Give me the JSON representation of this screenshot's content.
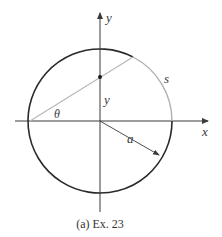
{
  "figure": {
    "caption": "(a)  Ex. 23",
    "labels": {
      "y_axis": "y",
      "x_axis": "x",
      "theta": "θ",
      "y_segment": "y",
      "arc": "s",
      "radius": "a"
    },
    "geometry": {
      "center": [
        100,
        121
      ],
      "radius": 72,
      "chord_start": [
        28,
        121
      ],
      "chord_end": [
        133,
        57
      ],
      "dot": [
        100,
        77
      ],
      "radius_arrow_end": [
        160,
        155
      ]
    },
    "colors": {
      "circle": "#2a2a2a",
      "arc_s": "#b0b0b0",
      "chord": "#b8b8b8",
      "axes": "#3a3a3a",
      "text": "#3a3a3a"
    }
  }
}
